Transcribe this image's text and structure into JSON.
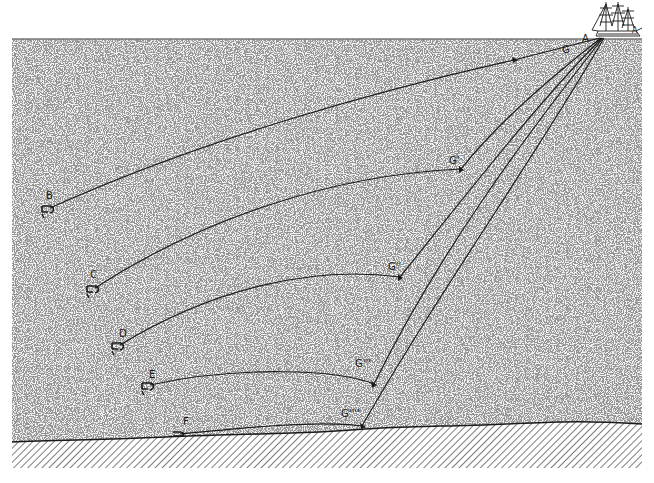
{
  "diagram": {
    "colors": {
      "background": "#ffffff",
      "water_stipple": "#5a5a5a",
      "ink": "#1a1a1a",
      "seabed_hatch": "#444444"
    },
    "ship": {
      "label": "A",
      "stern_label": "A"
    },
    "weights": [
      {
        "label": "G"
      },
      {
        "label": "G'"
      },
      {
        "label": "G''"
      },
      {
        "label": "G'''"
      },
      {
        "label": "G''''"
      }
    ],
    "anchors": [
      {
        "label": "B"
      },
      {
        "label": "C"
      },
      {
        "label": "D"
      },
      {
        "label": "E"
      },
      {
        "label": "F"
      }
    ]
  }
}
